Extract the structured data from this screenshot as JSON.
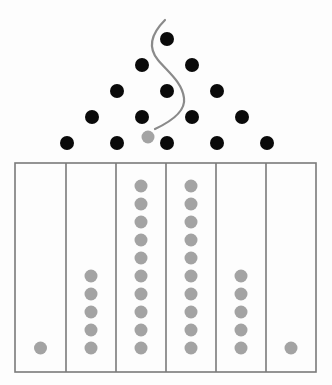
{
  "diagram": {
    "type": "galton-board",
    "colors": {
      "background": "#fdfdfd",
      "peg": "#0a0a0a",
      "ball": "#a3a3a3",
      "path": "#8a8a8a",
      "bin_border": "#7a7a7a"
    },
    "pegs": {
      "rows": 5,
      "radius": 7,
      "row_y": [
        39,
        65,
        91,
        117,
        143
      ],
      "center_x": 167,
      "spacing_x": 50
    },
    "falling_ball": {
      "cx": 148,
      "cy": 137,
      "r": 6.5
    },
    "path": {
      "d": "M165,20 C150,35 148,48 158,60 C168,72 182,82 184,98 C186,112 170,122 155,129"
    },
    "bins": {
      "x_edges": [
        15,
        66,
        116,
        166,
        216,
        266,
        316
      ],
      "top": 163,
      "bottom": 372,
      "ball_radius": 6.5,
      "ball_bottom_y": 348,
      "ball_spacing_y": 18,
      "counts": [
        1,
        5,
        10,
        10,
        5,
        1
      ]
    }
  }
}
